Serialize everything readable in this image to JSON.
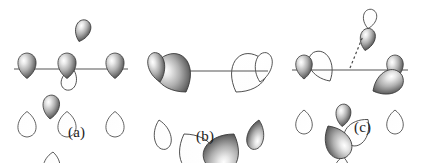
{
  "figure": {
    "background_color": "#ffffff",
    "outline_color": "#3a3a3a",
    "axis_color": "#555555",
    "lobe_light": "#fbfbfb",
    "lobe_mid": "#b8b8b8",
    "lobe_dark": "#3c3c3c",
    "panels": [
      {
        "id": "a",
        "label": "(a)",
        "description": "Three p-orbital pairs arranged along a horizontal axis, plus one tilted pair and one lower pair at the center atom",
        "axis": {
          "x1": 14,
          "y1": 69,
          "x2": 128,
          "y2": 69
        },
        "lobes": [
          {
            "name": "left-shaded-up",
            "cx": 27,
            "cy": 53,
            "angle": 0,
            "shaded": true,
            "rx": 11,
            "ry": 17
          },
          {
            "name": "left-open-down",
            "cx": 27,
            "cy": 86,
            "angle": 180,
            "shaded": false,
            "rx": 11,
            "ry": 17
          },
          {
            "name": "center-shaded-up",
            "cx": 67,
            "cy": 53,
            "angle": 0,
            "shaded": true,
            "rx": 11,
            "ry": 17
          },
          {
            "name": "center-open-down",
            "cx": 67,
            "cy": 86,
            "angle": 180,
            "shaded": false,
            "rx": 11,
            "ry": 17
          },
          {
            "name": "right-shaded-up",
            "cx": 115,
            "cy": 53,
            "angle": 0,
            "shaded": true,
            "rx": 11,
            "ry": 17
          },
          {
            "name": "right-open-down",
            "cx": 115,
            "cy": 86,
            "angle": 180,
            "shaded": false,
            "rx": 11,
            "ry": 17
          },
          {
            "name": "tilted-shaded-up",
            "cx": 79,
            "cy": 19,
            "angle": 18,
            "shaded": true,
            "rx": 9,
            "ry": 15
          },
          {
            "name": "tilted-open-down",
            "cx": 73,
            "cy": 46,
            "angle": 198,
            "shaded": false,
            "rx": 9,
            "ry": 15
          },
          {
            "name": "lower-shaded-up",
            "cx": 50,
            "cy": 95,
            "angle": 5,
            "shaded": true,
            "rx": 10,
            "ry": 16
          },
          {
            "name": "lower-open-down",
            "cx": 53,
            "cy": 128,
            "angle": 185,
            "shaded": false,
            "rx": 10,
            "ry": 16
          }
        ]
      },
      {
        "id": "b",
        "label": "(b)",
        "description": "Four broad lobes radiating from a central point in a plane; shaded lobes upper-left and lower-right, open lobes lower-left and upper-right",
        "axis": {
          "x1": 12,
          "y1": 71,
          "x2": 128,
          "y2": 71
        },
        "lobes": [
          {
            "name": "upper-left-large-shaded",
            "cx": 46,
            "cy": 50,
            "angle": -32,
            "shaded": true,
            "rx": 21,
            "ry": 28
          },
          {
            "name": "upper-left-small-shaded",
            "cx": 20,
            "cy": 52,
            "angle": -12,
            "shaded": true,
            "rx": 10,
            "ry": 20
          },
          {
            "name": "lower-left-large-open",
            "cx": 44,
            "cy": 92,
            "angle": 148,
            "shaded": false,
            "rx": 21,
            "ry": 28
          },
          {
            "name": "lower-left-small-open",
            "cx": 19,
            "cy": 90,
            "angle": 168,
            "shaded": false,
            "rx": 10,
            "ry": 20
          },
          {
            "name": "upper-right-large-open",
            "cx": 96,
            "cy": 50,
            "angle": 32,
            "shaded": false,
            "rx": 21,
            "ry": 28
          },
          {
            "name": "upper-right-small-open",
            "cx": 120,
            "cy": 52,
            "angle": 12,
            "shaded": false,
            "rx": 10,
            "ry": 20
          },
          {
            "name": "lower-right-large-shaded",
            "cx": 94,
            "cy": 92,
            "angle": -148,
            "shaded": true,
            "rx": 21,
            "ry": 28
          },
          {
            "name": "lower-right-small-shaded",
            "cx": 119,
            "cy": 90,
            "angle": -168,
            "shaded": true,
            "rx": 10,
            "ry": 20
          }
        ]
      },
      {
        "id": "c",
        "label": "(c)",
        "description": "Combination set: horizontal axis lobes plus broad in-plane lobes and a vertical lobe pair joined by a dashed line",
        "axis": {
          "x1": 12,
          "y1": 70,
          "x2": 128,
          "y2": 70
        },
        "dashed_line": {
          "x1": 70,
          "y1": 68,
          "x2": 83,
          "y2": 36
        },
        "lobes": [
          {
            "name": "left-shaded-up",
            "cx": 24,
            "cy": 55,
            "angle": 0,
            "shaded": true,
            "rx": 10,
            "ry": 16
          },
          {
            "name": "left-open-down",
            "cx": 24,
            "cy": 86,
            "angle": 180,
            "shaded": false,
            "rx": 10,
            "ry": 16
          },
          {
            "name": "right-shaded-up",
            "cx": 115,
            "cy": 55,
            "angle": 0,
            "shaded": true,
            "rx": 10,
            "ry": 16
          },
          {
            "name": "right-open-down",
            "cx": 115,
            "cy": 86,
            "angle": 180,
            "shaded": false,
            "rx": 10,
            "ry": 16
          },
          {
            "name": "upper-left-open",
            "cx": 50,
            "cy": 48,
            "angle": -30,
            "shaded": false,
            "rx": 13,
            "ry": 22
          },
          {
            "name": "lower-left-shaded",
            "cx": 48,
            "cy": 90,
            "angle": 150,
            "shaded": true,
            "rx": 15,
            "ry": 24
          },
          {
            "name": "upper-right-shaded",
            "cx": 93,
            "cy": 58,
            "angle": 62,
            "shaded": true,
            "rx": 14,
            "ry": 22
          },
          {
            "name": "lower-right-open",
            "cx": 88,
            "cy": 88,
            "angle": -140,
            "shaded": false,
            "rx": 13,
            "ry": 21
          },
          {
            "name": "bottom-shaded",
            "cx": 62,
            "cy": 104,
            "angle": 6,
            "shaded": true,
            "rx": 9,
            "ry": 15
          },
          {
            "name": "bottom-open",
            "cx": 63,
            "cy": 134,
            "angle": 186,
            "shaded": false,
            "rx": 9,
            "ry": 15
          },
          {
            "name": "vertical-shaded",
            "cx": 85,
            "cy": 28,
            "angle": 12,
            "shaded": true,
            "rx": 9,
            "ry": 15
          },
          {
            "name": "vertical-open",
            "cx": 88,
            "cy": 9,
            "angle": 10,
            "shaded": false,
            "rx": 8,
            "ry": 13
          }
        ]
      }
    ]
  }
}
